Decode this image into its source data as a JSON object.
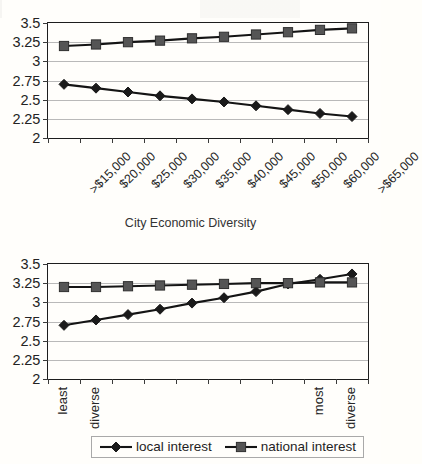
{
  "caption": "City Economic Diversity",
  "axis": {
    "y_ticks": [
      "3.5",
      "3.25",
      "3",
      "2.75",
      "2.5",
      "2.25",
      "2"
    ],
    "ylim": [
      2,
      3.5
    ]
  },
  "legend": {
    "items": [
      {
        "label": "local interest",
        "marker": "diamond",
        "color": "#1a1a1a"
      },
      {
        "label": "national interest",
        "marker": "square",
        "color": "#555555"
      }
    ]
  },
  "chart_data": [
    {
      "id": "chart-income",
      "type": "line",
      "title": "",
      "xlabel": "",
      "ylabel": "",
      "ylim": [
        2,
        3.5
      ],
      "ytick_step": 0.25,
      "grid": true,
      "legend_position": "bottom-shared",
      "categories": [
        ">$15,000",
        "$20,000",
        "$25,000",
        "$30,000",
        "$35,000",
        "$40,000",
        "$45,000",
        "$50,000",
        "$60,000",
        ">$65,000"
      ],
      "series": [
        {
          "name": "local interest",
          "marker": "diamond",
          "color": "#1a1a1a",
          "values": [
            2.7,
            2.65,
            2.6,
            2.55,
            2.51,
            2.47,
            2.42,
            2.37,
            2.32,
            2.28
          ]
        },
        {
          "name": "national interest",
          "marker": "square",
          "color": "#555555",
          "values": [
            3.2,
            3.22,
            3.25,
            3.27,
            3.3,
            3.32,
            3.35,
            3.38,
            3.41,
            3.43
          ]
        }
      ]
    },
    {
      "id": "chart-diversity",
      "type": "line",
      "title": "City Economic Diversity",
      "xlabel": "",
      "ylabel": "",
      "ylim": [
        2,
        3.5
      ],
      "ytick_step": 0.25,
      "grid": true,
      "legend_position": "bottom",
      "categories": [
        "1",
        "2",
        "3",
        "4",
        "5",
        "6",
        "7",
        "8",
        "9",
        "10"
      ],
      "xtick_labels": [
        {
          "index": 0,
          "text": "least"
        },
        {
          "index": 1,
          "text": "diverse"
        },
        {
          "index": 8,
          "text": "most"
        },
        {
          "index": 9,
          "text": "diverse"
        }
      ],
      "series": [
        {
          "name": "local interest",
          "marker": "diamond",
          "color": "#1a1a1a",
          "values": [
            2.7,
            2.77,
            2.84,
            2.91,
            2.99,
            3.06,
            3.14,
            3.24,
            3.3,
            3.37
          ]
        },
        {
          "name": "national interest",
          "marker": "square",
          "color": "#555555",
          "values": [
            3.2,
            3.2,
            3.21,
            3.22,
            3.23,
            3.24,
            3.25,
            3.25,
            3.26,
            3.26
          ]
        }
      ]
    }
  ]
}
